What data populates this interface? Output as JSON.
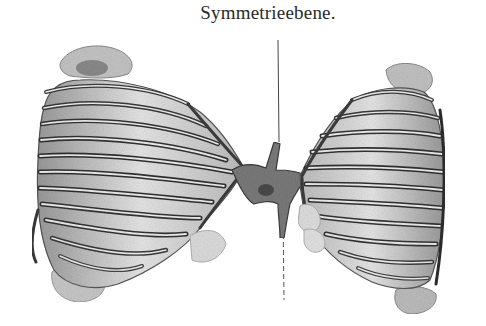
{
  "figure": {
    "caption": "Symmetrieebene.",
    "colors": {
      "background": "#ffffff",
      "ink_dark": "#2e2e2e",
      "ink_mid": "#6a6a6a",
      "ink_light": "#b8b8b8",
      "shade": "#d8d8d8"
    },
    "symmetry_line": {
      "x": 280,
      "y_start": 40,
      "y_end": 300,
      "style": "thin dashed vertical line"
    },
    "left_cage": {
      "label": "left rib cage",
      "rib_count": 11
    },
    "right_cage": {
      "label": "right rib cage",
      "rib_count": 11
    },
    "center": {
      "label": "sternal connection"
    }
  }
}
